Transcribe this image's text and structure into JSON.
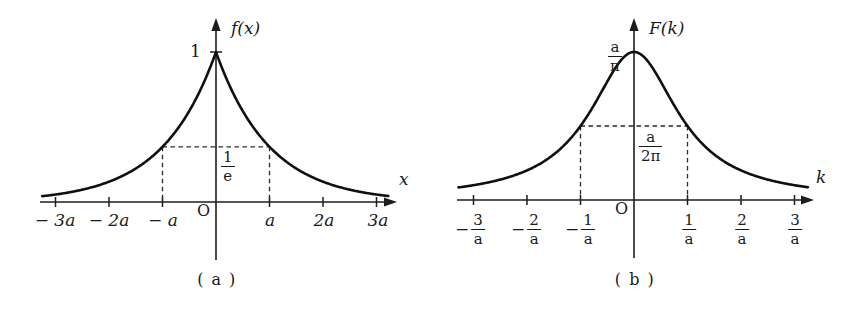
{
  "figure": {
    "background_color": "#ffffff",
    "line_color": "#101010",
    "panels": [
      {
        "id": "a",
        "caption": "( a )",
        "x_axis_label": "x",
        "y_axis_label": "f(x)",
        "origin_label": "O",
        "peak_label": "1",
        "level_label_numerator": "1",
        "level_label_denominator": "e",
        "x_tick_labels": [
          "− 3a",
          "− 2a",
          "− a",
          "a",
          "2a",
          "3a"
        ],
        "x_tick_values": [
          -3,
          -2,
          -1,
          1,
          2,
          3
        ]
      },
      {
        "id": "b",
        "caption": "( b )",
        "x_axis_label": "k",
        "y_axis_label": "F(k)",
        "origin_label": "O",
        "peak_label_numerator": "a",
        "peak_label_denominator": "π",
        "level_label_numerator": "a",
        "level_label_denominator": "2π",
        "x_tick_labels": [
          {
            "sign": "−",
            "num": "3",
            "den": "a"
          },
          {
            "sign": "−",
            "num": "2",
            "den": "a"
          },
          {
            "sign": "−",
            "num": "1",
            "den": "a"
          },
          {
            "sign": "",
            "num": "1",
            "den": "a"
          },
          {
            "sign": "",
            "num": "2",
            "den": "a"
          },
          {
            "sign": "",
            "num": "3",
            "den": "a"
          }
        ],
        "x_tick_values": [
          -3,
          -2,
          -1,
          1,
          2,
          3
        ]
      }
    ]
  },
  "chart_data": [
    {
      "type": "line",
      "title": "(a)",
      "function": "f(x) = exp(-|x|/a)",
      "xlabel": "x",
      "ylabel": "f(x)",
      "xlim": [
        -3.4,
        3.4
      ],
      "ylim": [
        0,
        1.08
      ],
      "grid": false,
      "legend": false,
      "xticks": [
        -3,
        -2,
        -1,
        0,
        1,
        2,
        3
      ],
      "xticklabels": [
        "−3a",
        "−2a",
        "−a",
        "O",
        "a",
        "2a",
        "3a"
      ],
      "yticks": [
        0.3679,
        1
      ],
      "yticklabels": [
        "1/e",
        "1"
      ],
      "annotations": [
        {
          "text": "1",
          "x": 0,
          "y": 1,
          "note": "peak value at origin"
        },
        {
          "text": "1/e",
          "x": 0,
          "y": 0.3679,
          "note": "value of f at x = ±a, marked with dashed guide lines"
        }
      ],
      "x": [
        -3.4,
        -3.2,
        -3.0,
        -2.8,
        -2.6,
        -2.4,
        -2.2,
        -2.0,
        -1.8,
        -1.6,
        -1.4,
        -1.2,
        -1.0,
        -0.8,
        -0.6,
        -0.4,
        -0.2,
        0.0,
        0.2,
        0.4,
        0.6,
        0.8,
        1.0,
        1.2,
        1.4,
        1.6,
        1.8,
        2.0,
        2.2,
        2.4,
        2.6,
        2.8,
        3.0,
        3.2,
        3.4
      ],
      "values": [
        0.0334,
        0.0408,
        0.0498,
        0.0608,
        0.0743,
        0.0907,
        0.1108,
        0.1353,
        0.1653,
        0.2019,
        0.2466,
        0.3012,
        0.3679,
        0.4493,
        0.5488,
        0.6703,
        0.8187,
        1.0,
        0.8187,
        0.6703,
        0.5488,
        0.4493,
        0.3679,
        0.3012,
        0.2466,
        0.2019,
        0.1653,
        0.1353,
        0.1108,
        0.0907,
        0.0743,
        0.0608,
        0.0498,
        0.0408,
        0.0334
      ]
    },
    {
      "type": "line",
      "title": "(b)",
      "function": "F(k) = (a/π) / (1 + a²k²)",
      "xlabel": "k",
      "ylabel": "F(k)",
      "xlim": [
        -3.4,
        3.4
      ],
      "ylim": [
        0,
        1.08
      ],
      "grid": false,
      "legend": false,
      "xticks": [
        -3,
        -2,
        -1,
        0,
        1,
        2,
        3
      ],
      "xticklabels": [
        "−3/a",
        "−2/a",
        "−1/a",
        "O",
        "1/a",
        "2/a",
        "3/a"
      ],
      "yticks": [
        0.5,
        1
      ],
      "yticklabels": [
        "a/2π",
        "a/π"
      ],
      "annotations": [
        {
          "text": "a/π",
          "x": 0,
          "y": 1,
          "note": "peak value at origin"
        },
        {
          "text": "a/2π",
          "x": 0,
          "y": 0.5,
          "note": "half-maximum value at k = ±1/a, marked with dashed guide lines"
        }
      ],
      "x": [
        -3.4,
        -3.2,
        -3.0,
        -2.8,
        -2.6,
        -2.4,
        -2.2,
        -2.0,
        -1.8,
        -1.6,
        -1.4,
        -1.2,
        -1.0,
        -0.8,
        -0.6,
        -0.4,
        -0.2,
        0.0,
        0.2,
        0.4,
        0.6,
        0.8,
        1.0,
        1.2,
        1.4,
        1.6,
        1.8,
        2.0,
        2.2,
        2.4,
        2.6,
        2.8,
        3.0,
        3.2,
        3.4
      ],
      "values": [
        0.0796,
        0.089,
        0.1,
        0.1131,
        0.1289,
        0.1481,
        0.1712,
        0.2,
        0.2358,
        0.2809,
        0.3378,
        0.4098,
        0.5,
        0.6098,
        0.7353,
        0.8621,
        0.9615,
        1.0,
        0.9615,
        0.8621,
        0.7353,
        0.6098,
        0.5,
        0.4098,
        0.3378,
        0.2809,
        0.2358,
        0.2,
        0.1712,
        0.1481,
        0.1289,
        0.1131,
        0.1,
        0.089,
        0.0796
      ]
    }
  ]
}
